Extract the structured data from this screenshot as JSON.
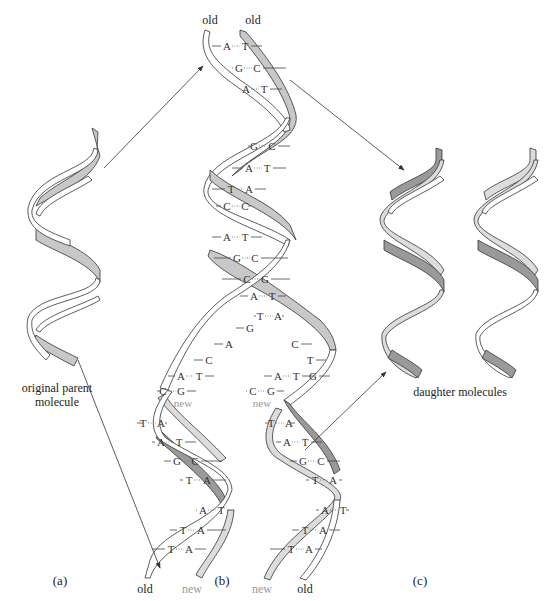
{
  "figure": {
    "panels": [
      {
        "id": "a",
        "label": "(a)",
        "caption": [
          "original parent",
          "molecule"
        ]
      },
      {
        "id": "b",
        "label": "(b)"
      },
      {
        "id": "c",
        "label": "(c)",
        "caption": [
          "daughter molecules"
        ]
      }
    ],
    "strand_labels": {
      "top_left": "old",
      "top_right": "old",
      "left_helix_bottom_old": "old",
      "left_helix_bottom_new": "new",
      "right_helix_bottom_new": "new",
      "right_helix_bottom_old": "old",
      "left_fork_new": "new",
      "right_fork_new": "new"
    },
    "parent_helix_pairs": [
      [
        "A",
        "T"
      ],
      [
        "G",
        "C"
      ],
      [
        "A",
        "T"
      ],
      [
        "G",
        "C"
      ],
      [
        "A",
        "T"
      ],
      [
        "T",
        "A"
      ],
      [
        "C",
        "C"
      ],
      [
        "A",
        "T"
      ],
      [
        "G",
        "C"
      ],
      [
        "C",
        "G"
      ],
      [
        "A",
        "T"
      ],
      [
        "T",
        "A"
      ]
    ],
    "fork_left_bases": [
      "G",
      "A",
      "C"
    ],
    "fork_left_pairs": [
      [
        "A",
        "T"
      ],
      [
        "C",
        "G"
      ]
    ],
    "fork_right_bases": [
      "C",
      "T",
      "G"
    ],
    "fork_right_pairs": [
      [
        "A",
        "T"
      ],
      [
        "C",
        "G"
      ]
    ],
    "left_daughter_pairs": [
      [
        "T",
        "A"
      ],
      [
        "A",
        "T"
      ],
      [
        "G",
        "C"
      ],
      [
        "T",
        "A"
      ],
      [
        "A",
        "T"
      ],
      [
        "T",
        "A"
      ],
      [
        "T",
        "A"
      ]
    ],
    "right_daughter_pairs": [
      [
        "T",
        "A"
      ],
      [
        "A",
        "T"
      ],
      [
        "G",
        "C"
      ],
      [
        "T",
        "A"
      ],
      [
        "A",
        "T"
      ],
      [
        "T",
        "A"
      ],
      [
        "T",
        "A"
      ]
    ],
    "colors": {
      "old_strand": "#ffffff",
      "new_strand": "#d4d4d4",
      "parent_backside": "#c8c8c8",
      "outline": "#333333",
      "new_label": "#999999"
    }
  }
}
